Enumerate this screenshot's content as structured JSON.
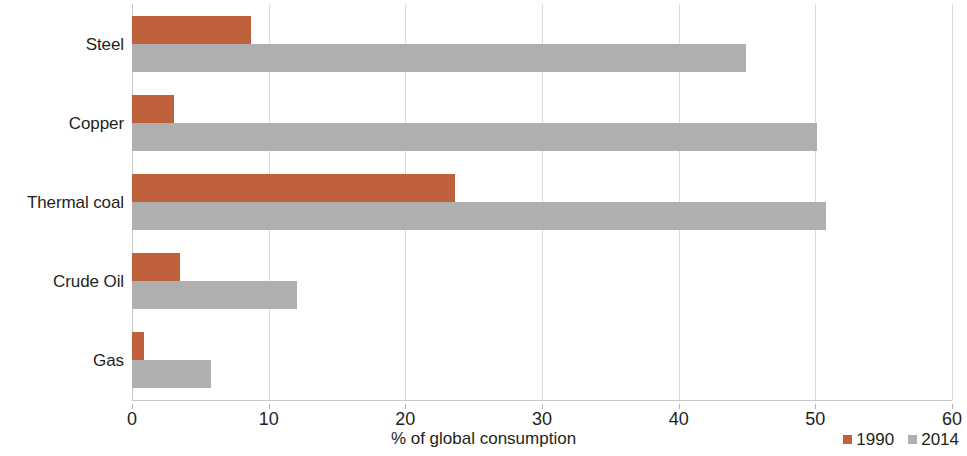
{
  "chart_data": {
    "type": "bar",
    "orientation": "horizontal",
    "title": "",
    "xlabel": "% of global consumption",
    "ylabel": "",
    "xlim": [
      0,
      60
    ],
    "xticks": [
      0,
      10,
      20,
      30,
      40,
      50,
      60
    ],
    "xtick_labels": [
      "0",
      "10",
      "20",
      "30",
      "40",
      "50",
      "60"
    ],
    "grid": true,
    "grid_axis": "x",
    "legend_position": "bottom-right",
    "categories": [
      "Steel",
      "Copper",
      "Thermal coal",
      "Crude Oil",
      "Gas"
    ],
    "series": [
      {
        "name": "1990",
        "color": "#c0613d",
        "values": [
          8.7,
          3.1,
          23.6,
          3.5,
          0.9
        ]
      },
      {
        "name": "2014",
        "color": "#afafaf",
        "values": [
          44.9,
          50.1,
          50.8,
          12.1,
          5.8
        ]
      }
    ]
  },
  "legend": {
    "items": [
      {
        "label": "1990",
        "color": "#c0613d"
      },
      {
        "label": "2014",
        "color": "#afafaf"
      }
    ]
  },
  "axis": {
    "x_title": "% of global consumption"
  }
}
